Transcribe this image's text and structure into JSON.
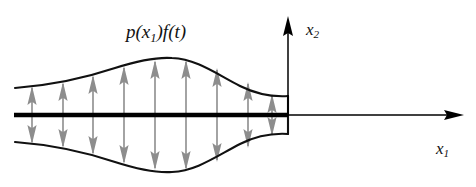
{
  "figure": {
    "type": "engineering-diagram",
    "width": 476,
    "height": 187,
    "background_color": "#ffffff"
  },
  "labels": {
    "load": {
      "text_plain": "p(x1)f(t)",
      "parts": {
        "p": "p",
        "open_paren": "(",
        "x": "x",
        "sub1": "1",
        "close_paren": ")",
        "f": "f",
        "open_paren2": "(",
        "t": "t",
        "close_paren2": ")"
      }
    },
    "x2_axis": {
      "text_plain": "x2",
      "base": "x",
      "sub": "2"
    },
    "x1_axis": {
      "text_plain": "x1",
      "base": "x",
      "sub": "1"
    }
  },
  "colors": {
    "stroke": "#111111",
    "axis": "#000000",
    "arrow_gray": "#8d8d8d",
    "arrow_gray_dark": "#7a7a7a",
    "background": "#ffffff"
  },
  "geometry": {
    "baseline_y": 115,
    "baseline_x_start": 14,
    "baseline_x_end": 464,
    "vertical_axis_x": 288,
    "vertical_axis_top_y": 16,
    "body_left_x": 15,
    "body_right_x": 288,
    "top_curve_peak": {
      "x": 170,
      "y": 59
    },
    "bottom_curve_trough": {
      "x": 170,
      "y": 171
    },
    "right_edge_top_y": 96,
    "right_edge_bottom_y": 134,
    "left_edge_top_y": 88,
    "left_edge_bottom_y": 142
  },
  "arrow_columns": [
    {
      "x": 32,
      "top_y": 86,
      "bottom_y": 144
    },
    {
      "x": 63,
      "top_y": 82,
      "bottom_y": 148
    },
    {
      "x": 93,
      "top_y": 75,
      "bottom_y": 155
    },
    {
      "x": 124,
      "top_y": 66,
      "bottom_y": 164
    },
    {
      "x": 155,
      "top_y": 60,
      "bottom_y": 170
    },
    {
      "x": 186,
      "top_y": 60,
      "bottom_y": 170
    },
    {
      "x": 217,
      "top_y": 68,
      "bottom_y": 162
    },
    {
      "x": 248,
      "top_y": 82,
      "bottom_y": 148
    },
    {
      "x": 272,
      "top_y": 94,
      "bottom_y": 136
    }
  ],
  "arrow_style": {
    "stem_width": 1.6,
    "head_width": 9,
    "head_length": 20,
    "direction": "double-headed-outward"
  }
}
